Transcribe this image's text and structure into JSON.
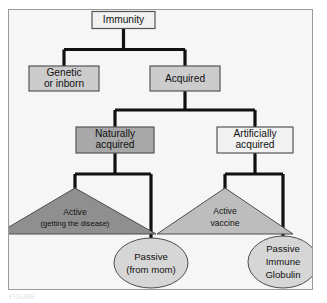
{
  "figure": {
    "caption_partial": "FIGURE"
  },
  "colors": {
    "panel_background": "#f6f6f6",
    "panel_border": "#9a9a9a",
    "connector": "#111111",
    "box_light": "#f1f1f1",
    "box_mid": "#cccccc",
    "box_dark": "#a8a8a8",
    "triangle_dark": "#8f8f8f",
    "triangle_light": "#bdbdbd",
    "ellipse_light": "#d6d6d6",
    "shape_outline": "#555555",
    "text": "#111111"
  },
  "nodes": {
    "root": {
      "label": "Immunity",
      "shape": "rect",
      "fill": "box_light"
    },
    "genetic": {
      "label_line1": "Genetic",
      "label_line2": "or inborn",
      "shape": "rect",
      "fill": "box_mid"
    },
    "acquired": {
      "label": "Acquired",
      "shape": "rect",
      "fill": "box_mid"
    },
    "naturally_acquired": {
      "label_line1": "Naturally",
      "label_line2": "acquired",
      "shape": "rect",
      "fill": "box_dark"
    },
    "artificially_acquired": {
      "label_line1": "Artificially",
      "label_line2": "acquired",
      "shape": "rect",
      "fill": "box_light"
    },
    "active_disease": {
      "label_line1": "Active",
      "label_line2": "(getting the disease)",
      "shape": "triangle",
      "fill": "triangle_dark"
    },
    "active_vaccine": {
      "label_line1": "Active",
      "label_line2": "vaccine",
      "shape": "triangle",
      "fill": "triangle_light"
    },
    "passive_mom": {
      "label_line1": "Passive",
      "label_line2": "(from mom)",
      "shape": "ellipse",
      "fill": "ellipse_light"
    },
    "passive_immune_globulin": {
      "label_line1": "Passive",
      "label_line2": "Immune",
      "label_line3": "Globulin",
      "shape": "ellipse",
      "fill": "ellipse_light"
    }
  },
  "edges": [
    {
      "from": "root",
      "to": "genetic"
    },
    {
      "from": "root",
      "to": "acquired"
    },
    {
      "from": "acquired",
      "to": "naturally_acquired"
    },
    {
      "from": "acquired",
      "to": "artificially_acquired"
    },
    {
      "from": "naturally_acquired",
      "to": "active_disease"
    },
    {
      "from": "naturally_acquired",
      "to": "passive_mom"
    },
    {
      "from": "artificially_acquired",
      "to": "active_vaccine"
    },
    {
      "from": "artificially_acquired",
      "to": "passive_immune_globulin"
    }
  ]
}
